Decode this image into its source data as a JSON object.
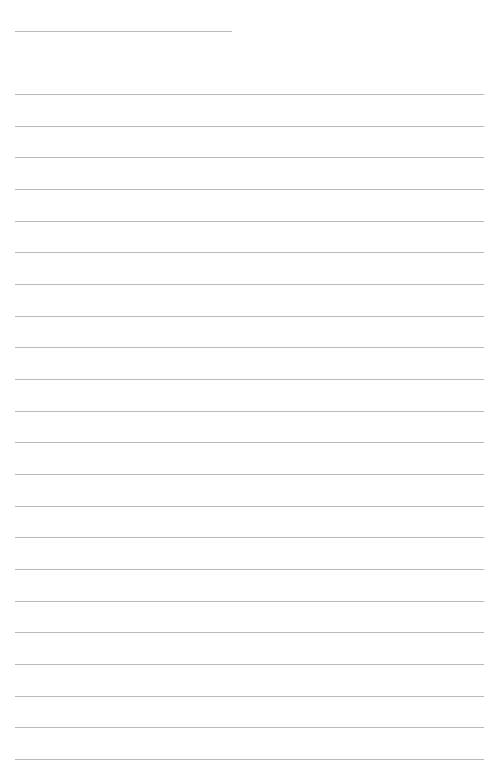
{
  "page": {
    "type": "lined-paper",
    "background": "#ffffff",
    "line_color": "#b9b9b9",
    "title_line": {
      "x1": 15,
      "x2": 232,
      "y": 31
    },
    "ruled_lines": {
      "count": 22,
      "x1": 15,
      "x2": 484,
      "first_y": 94,
      "spacing": 31.67
    }
  }
}
